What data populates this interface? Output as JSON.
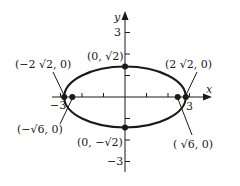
{
  "diagram": {
    "type": "ellipse-on-coordinate-axes",
    "equation_hint": "x^2/8 + y^2/2 = 1",
    "axes": {
      "x_label": "x",
      "y_label": "y",
      "x_ticks": [
        -3,
        -2,
        -1,
        1,
        2,
        3
      ],
      "y_ticks": [
        -3,
        -2,
        -1,
        1,
        2,
        3
      ],
      "x_tick_labels": {
        "neg": "−3",
        "pos": "3"
      },
      "y_tick_labels": {
        "pos": "3",
        "neg": "−3"
      }
    },
    "ellipse": {
      "center": [
        0,
        0
      ],
      "semi_major_x": "2√2",
      "semi_minor_y": "√2"
    },
    "points": [
      {
        "id": "vertex-left",
        "label": "(−2 √2, 0)",
        "x": -2.828,
        "y": 0
      },
      {
        "id": "vertex-right",
        "label": "(2 √2, 0)",
        "x": 2.828,
        "y": 0
      },
      {
        "id": "covertex-top",
        "label": "(0, √2)",
        "x": 0,
        "y": 1.414
      },
      {
        "id": "covertex-bottom",
        "label": "(0, −√2)",
        "x": 0,
        "y": -1.414
      },
      {
        "id": "focus-left",
        "label": "(−√6, 0)",
        "x": -2.449,
        "y": 0
      },
      {
        "id": "focus-right",
        "label": "( √6, 0)",
        "x": 2.449,
        "y": 0
      }
    ],
    "colors": {
      "ink": "#1a1a1a",
      "background": "#ffffff"
    }
  }
}
